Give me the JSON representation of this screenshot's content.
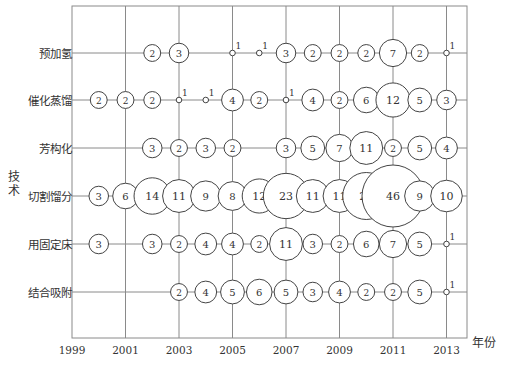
{
  "chart_data": {
    "type": "scatter",
    "subtype": "bubble",
    "title": "",
    "xlabel": "年份",
    "ylabel": "技术",
    "x_ticks": [
      "1999",
      "2001",
      "2003",
      "2005",
      "2007",
      "2009",
      "2011",
      "2013"
    ],
    "xlim": [
      1999,
      2014
    ],
    "grid": true,
    "categories": [
      "预加氢",
      "催化蒸馏",
      "芳构化",
      "切割馏分",
      "用固定床",
      "结合吸附"
    ],
    "series": [
      {
        "name": "预加氢",
        "points": [
          [
            2002,
            2
          ],
          [
            2003,
            3
          ],
          [
            2005,
            1
          ],
          [
            2006,
            1
          ],
          [
            2007,
            3
          ],
          [
            2008,
            2
          ],
          [
            2009,
            2
          ],
          [
            2010,
            2
          ],
          [
            2011,
            7
          ],
          [
            2012,
            2
          ],
          [
            2013,
            1
          ]
        ]
      },
      {
        "name": "催化蒸馏",
        "points": [
          [
            2000,
            2
          ],
          [
            2001,
            2
          ],
          [
            2002,
            2
          ],
          [
            2003,
            1
          ],
          [
            2004,
            1
          ],
          [
            2005,
            4
          ],
          [
            2006,
            2
          ],
          [
            2007,
            1
          ],
          [
            2008,
            4
          ],
          [
            2009,
            2
          ],
          [
            2010,
            6
          ],
          [
            2011,
            12
          ],
          [
            2012,
            5
          ],
          [
            2013,
            3
          ]
        ]
      },
      {
        "name": "芳构化",
        "points": [
          [
            2002,
            3
          ],
          [
            2003,
            2
          ],
          [
            2004,
            3
          ],
          [
            2005,
            2
          ],
          [
            2007,
            3
          ],
          [
            2008,
            5
          ],
          [
            2009,
            7
          ],
          [
            2010,
            11
          ],
          [
            2011,
            2
          ],
          [
            2012,
            5
          ],
          [
            2013,
            4
          ]
        ]
      },
      {
        "name": "切割馏分",
        "points": [
          [
            2000,
            3
          ],
          [
            2001,
            6
          ],
          [
            2002,
            14
          ],
          [
            2003,
            11
          ],
          [
            2004,
            9
          ],
          [
            2005,
            8
          ],
          [
            2006,
            12
          ],
          [
            2007,
            23
          ],
          [
            2008,
            11
          ],
          [
            2009,
            11
          ],
          [
            2010,
            25
          ],
          [
            2011,
            46
          ],
          [
            2012,
            9
          ],
          [
            2013,
            10
          ]
        ]
      },
      {
        "name": "用固定床",
        "points": [
          [
            2000,
            3
          ],
          [
            2002,
            3
          ],
          [
            2003,
            2
          ],
          [
            2004,
            4
          ],
          [
            2005,
            4
          ],
          [
            2006,
            2
          ],
          [
            2007,
            11
          ],
          [
            2008,
            3
          ],
          [
            2009,
            2
          ],
          [
            2010,
            6
          ],
          [
            2011,
            7
          ],
          [
            2012,
            5
          ],
          [
            2013,
            1
          ]
        ]
      },
      {
        "name": "结合吸附",
        "points": [
          [
            2003,
            2
          ],
          [
            2004,
            4
          ],
          [
            2005,
            5
          ],
          [
            2006,
            6
          ],
          [
            2007,
            5
          ],
          [
            2008,
            3
          ],
          [
            2009,
            4
          ],
          [
            2010,
            2
          ],
          [
            2011,
            2
          ],
          [
            2012,
            5
          ],
          [
            2013,
            1
          ]
        ]
      }
    ],
    "legend": "none"
  },
  "colors": {
    "line": "#8a8a8a",
    "bubble_stroke": "#444444",
    "text": "#333333"
  }
}
